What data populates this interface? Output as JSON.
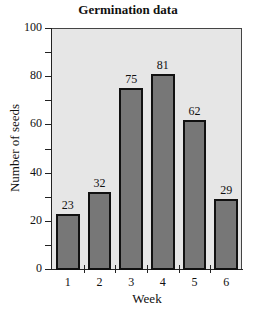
{
  "chart_data": {
    "type": "bar",
    "title": "Germination data",
    "xlabel": "Week",
    "ylabel": "Number of seeds",
    "categories": [
      "1",
      "2",
      "3",
      "4",
      "5",
      "6"
    ],
    "values": [
      23,
      32,
      75,
      81,
      62,
      29
    ],
    "ylim": [
      0,
      100
    ],
    "yticks": [
      0,
      20,
      40,
      60,
      80,
      100
    ],
    "grid": false,
    "legend": null
  }
}
